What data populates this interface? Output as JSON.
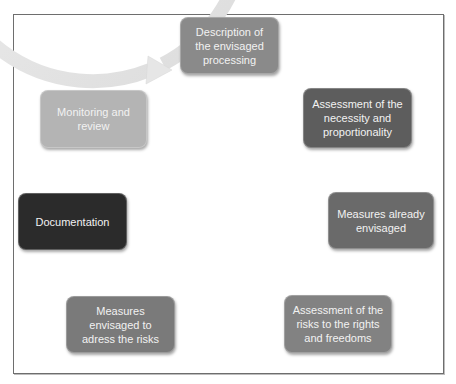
{
  "diagram": {
    "type": "cycle",
    "direction": "clockwise",
    "nodes": [
      {
        "id": "description",
        "label": "Description of the envisaged processing",
        "color": "#8a8a8a"
      },
      {
        "id": "necessity",
        "label": "Assessment of the necessity and proportionality",
        "color": "#5d5d5d"
      },
      {
        "id": "measures-already",
        "label": "Measures already envisaged",
        "color": "#6a6a6a"
      },
      {
        "id": "risk-assessment",
        "label": "Assessment of the risks to the rights and freedoms",
        "color": "#828282"
      },
      {
        "id": "measures-risks",
        "label": "Measures envisaged to adress the risks",
        "color": "#7a7a7a"
      },
      {
        "id": "documentation",
        "label": "Documentation",
        "color": "#2b2b2b"
      },
      {
        "id": "monitoring",
        "label": "Monitoring and review",
        "color": "#b4b4b4"
      }
    ],
    "ring_color": "#e4e4e4",
    "frame_color": "#6e6e6e"
  }
}
